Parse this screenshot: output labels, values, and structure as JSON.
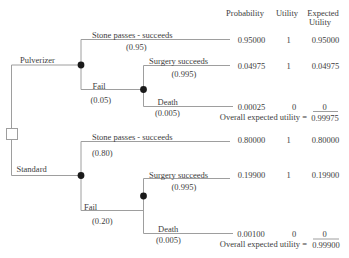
{
  "header": {
    "probability": "Probability",
    "utility": "Utility",
    "expected_1": "Expected",
    "expected_2": "Utility"
  },
  "tree": {
    "node_types": {
      "root": "decision-square",
      "branch_nodes": "chance-circle"
    },
    "pulverizer": {
      "label": "Pulverizer",
      "stone": {
        "label": "Stone passes - succeeds",
        "prob": "(0.95)",
        "probability": "0.95000",
        "utility": "1",
        "expected": "0.95000"
      },
      "fail": {
        "label": "Fail",
        "prob": "(0.05)"
      },
      "surgery": {
        "label": "Surgery succeeds",
        "prob": "(0.995)",
        "probability": "0.04975",
        "utility": "1",
        "expected": "0.04975"
      },
      "death": {
        "label": "Death",
        "prob": "(0.005)",
        "probability": "0.00025",
        "utility": "0",
        "expected": "0"
      },
      "overall_label": "Overall expected utility =",
      "overall_value": "0.99975"
    },
    "standard": {
      "label": "Standard",
      "stone": {
        "label": "Stone passes - succeeds",
        "prob": "(0.80)",
        "probability": "0.80000",
        "utility": "1",
        "expected": "0.80000"
      },
      "fail": {
        "label": "Fail",
        "prob": "(0.20)"
      },
      "surgery": {
        "label": "Surgery succeeds",
        "prob": "(0.995)",
        "probability": "0.19900",
        "utility": "1",
        "expected": "0.19900"
      },
      "death": {
        "label": "Death",
        "prob": "(0.005)",
        "probability": "0.00100",
        "utility": "0",
        "expected": "0"
      },
      "overall_label": "Overall expected utility =",
      "overall_value": "0.99900"
    }
  },
  "colors": {
    "line": "#9e9e9e",
    "node": "#1a1a1a",
    "text": "#3d3d3d"
  }
}
